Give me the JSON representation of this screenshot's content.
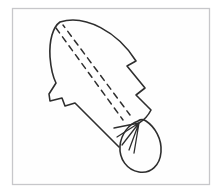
{
  "figure": {
    "name": "leaf-gather-pattern-diagram",
    "parts": {
      "leaf_outline": "jagged-edged leaf shape with smooth curved top and stepped notches on both sides",
      "stitch_lines": "two parallel dashed stitching lines running from the leaf tip down the center to the gathered base",
      "gather_folds": "fold lines radiating from the gathering point at the leaf base",
      "tail_loop": "egg-shaped loop hanging from the gathered base"
    }
  },
  "colors": {
    "background": "#ffffff",
    "paper": "#fefefe",
    "frame_border": "#c7c7ca",
    "ink": "#2e2e2e"
  }
}
